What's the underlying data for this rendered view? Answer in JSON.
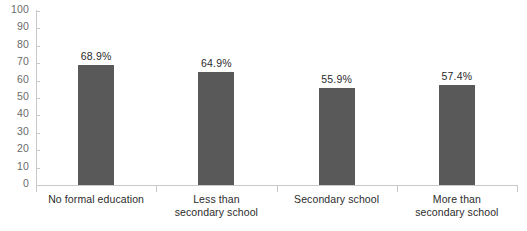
{
  "chart_data": {
    "type": "bar",
    "title": "",
    "subtitle": "",
    "xlabel": "",
    "ylabel": "",
    "ylim": [
      0,
      100
    ],
    "ytick_labels": [
      "100",
      "90",
      "80",
      "70",
      "60",
      "50",
      "40",
      "30",
      "20",
      "10",
      "0"
    ],
    "ytick_values": [
      100,
      90,
      80,
      70,
      60,
      50,
      40,
      30,
      20,
      10,
      0
    ],
    "grid": false,
    "legend": false,
    "legend_position": "none",
    "bar_color": "#595959",
    "axis_color": "#c9c9c9",
    "label_color": "#2b2b2b",
    "tick_label_color": "#6b6b6b",
    "categories": [
      "No formal education",
      "Less than secondary school",
      "Secondary school",
      "More than secondary school"
    ],
    "category_lines": [
      [
        "No formal education"
      ],
      [
        "Less than",
        "secondary school"
      ],
      [
        "Secondary school"
      ],
      [
        "More than",
        "secondary school"
      ]
    ],
    "values": [
      68.9,
      64.9,
      55.9,
      57.4
    ],
    "value_labels": [
      "68.9%",
      "64.9%",
      "55.9%",
      "57.4%"
    ]
  }
}
